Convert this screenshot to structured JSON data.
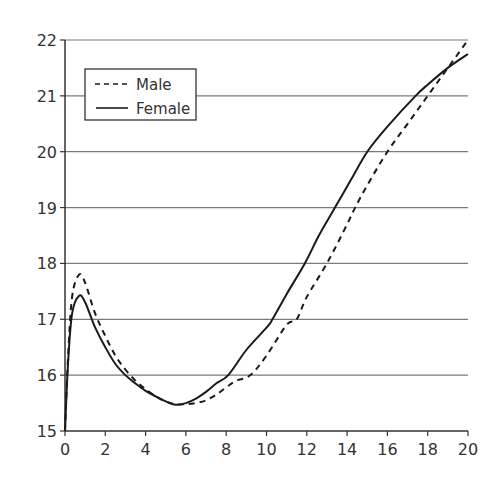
{
  "chart_data": {
    "type": "line",
    "title": "",
    "xlabel": "",
    "ylabel": "",
    "xlim": [
      0,
      20
    ],
    "ylim": [
      15,
      22
    ],
    "x_ticks": [
      0,
      2,
      4,
      6,
      8,
      10,
      12,
      14,
      16,
      18,
      20
    ],
    "y_ticks": [
      15,
      16,
      17,
      18,
      19,
      20,
      21,
      22
    ],
    "grid": "horizontal",
    "legend": {
      "position": "upper-left",
      "entries": [
        "Male",
        "Female"
      ]
    },
    "series": [
      {
        "name": "Male",
        "style": "dashed",
        "color": "#1a1a1a",
        "points": [
          [
            0,
            15.0
          ],
          [
            0.15,
            16.3
          ],
          [
            0.35,
            17.4
          ],
          [
            0.7,
            17.8
          ],
          [
            1.0,
            17.65
          ],
          [
            1.5,
            17.1
          ],
          [
            2,
            16.7
          ],
          [
            2.5,
            16.35
          ],
          [
            3,
            16.1
          ],
          [
            3.5,
            15.9
          ],
          [
            4,
            15.75
          ],
          [
            4.5,
            15.62
          ],
          [
            5,
            15.53
          ],
          [
            5.5,
            15.48
          ],
          [
            6,
            15.48
          ],
          [
            6.5,
            15.5
          ],
          [
            7,
            15.55
          ],
          [
            7.5,
            15.65
          ],
          [
            8,
            15.78
          ],
          [
            8.5,
            15.9
          ],
          [
            9.2,
            16.0
          ],
          [
            10,
            16.35
          ],
          [
            11,
            16.9
          ],
          [
            11.5,
            17.0
          ],
          [
            12,
            17.4
          ],
          [
            13,
            18.0
          ],
          [
            14,
            18.7
          ],
          [
            14.4,
            19.0
          ],
          [
            15,
            19.4
          ],
          [
            16,
            20.0
          ],
          [
            17,
            20.5
          ],
          [
            18,
            21.0
          ],
          [
            19,
            21.5
          ],
          [
            20,
            22.0
          ]
        ]
      },
      {
        "name": "Female",
        "style": "solid",
        "color": "#1a1a1a",
        "points": [
          [
            0,
            15.0
          ],
          [
            0.15,
            16.2
          ],
          [
            0.35,
            17.1
          ],
          [
            0.7,
            17.42
          ],
          [
            1.0,
            17.3
          ],
          [
            1.5,
            16.85
          ],
          [
            2,
            16.5
          ],
          [
            2.5,
            16.2
          ],
          [
            3,
            16.0
          ],
          [
            3.5,
            15.85
          ],
          [
            4,
            15.72
          ],
          [
            4.5,
            15.62
          ],
          [
            5,
            15.53
          ],
          [
            5.5,
            15.47
          ],
          [
            6,
            15.5
          ],
          [
            6.5,
            15.58
          ],
          [
            7,
            15.7
          ],
          [
            7.5,
            15.85
          ],
          [
            8.1,
            16.0
          ],
          [
            9,
            16.45
          ],
          [
            10,
            16.85
          ],
          [
            10.3,
            17.0
          ],
          [
            11,
            17.45
          ],
          [
            11.9,
            18.0
          ],
          [
            12.6,
            18.5
          ],
          [
            13.4,
            19.0
          ],
          [
            14.2,
            19.5
          ],
          [
            15,
            20.0
          ],
          [
            16,
            20.45
          ],
          [
            17.4,
            21.0
          ],
          [
            18,
            21.2
          ],
          [
            19,
            21.5
          ],
          [
            20,
            21.75
          ]
        ]
      }
    ]
  },
  "legend": {
    "male_label": "Male",
    "female_label": "Female"
  },
  "colors": {
    "axis": "#333333",
    "grid": "#7a7a7a",
    "line": "#1a1a1a",
    "background": "#ffffff"
  }
}
